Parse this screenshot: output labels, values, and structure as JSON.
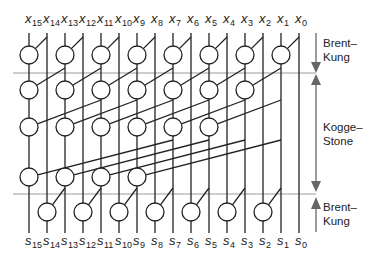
{
  "diagram": {
    "bits": 16,
    "inputs": [
      "x15",
      "x14",
      "x13",
      "x12",
      "x11",
      "x10",
      "x9",
      "x8",
      "x7",
      "x6",
      "x5",
      "x4",
      "x3",
      "x2",
      "x1",
      "x0"
    ],
    "outputs": [
      "s15",
      "s14",
      "s13",
      "s12",
      "s11",
      "s10",
      "s9",
      "s8",
      "s7",
      "s6",
      "s5",
      "s4",
      "s3",
      "s2",
      "s1",
      "s0"
    ],
    "input_prefix": "x",
    "output_prefix": "s",
    "stages": [
      {
        "name": "Brent-Kung",
        "row": 1,
        "span": 1,
        "node_bits": [
          15,
          13,
          11,
          9,
          7,
          5,
          3,
          1
        ]
      },
      {
        "name": "Kogge-Stone",
        "row": 2,
        "span": 2,
        "node_bits": [
          15,
          13,
          11,
          9,
          7,
          5,
          3
        ]
      },
      {
        "name": "Kogge-Stone",
        "row": 3,
        "span": 4,
        "node_bits": [
          15,
          13,
          11,
          9,
          7,
          5
        ]
      },
      {
        "name": "Kogge-Stone",
        "row": 4,
        "span": 8,
        "node_bits": [
          15,
          13,
          11,
          9
        ]
      },
      {
        "name": "Brent-Kung",
        "row": 5,
        "span": 1,
        "node_bits": [
          14,
          12,
          10,
          8,
          6,
          4,
          2
        ]
      }
    ],
    "side_labels": {
      "top": {
        "line1": "Brent–",
        "line2": "Kung"
      },
      "middle": {
        "line1": "Kogge–",
        "line2": "Stone"
      },
      "bottom": {
        "line1": "Brent–",
        "line2": "Kung"
      }
    },
    "colors": {
      "wire": "#222222",
      "separator": "#9a9a9a",
      "arrow": "#666666"
    }
  }
}
